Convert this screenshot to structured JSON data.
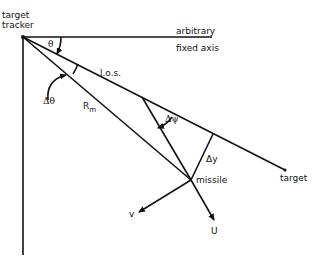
{
  "diagram": {
    "labels": {
      "tracker_line1": "target",
      "tracker_line2": "tracker",
      "theta": "θ",
      "axis_line1": "arbitrary",
      "axis_line2": "fixed axis",
      "los": "l.o.s.",
      "delta_theta": "Δθ",
      "rm": "R",
      "rm_sub": "m",
      "delta_psi": "Δψ",
      "delta_y": "Δy",
      "missile": "missile",
      "target": "target",
      "v": "v",
      "u": "U"
    },
    "points": {
      "tracker": [
        23,
        37
      ],
      "axis_end": [
        212,
        38
      ],
      "vertical_end": [
        23,
        255
      ],
      "target": [
        285,
        170
      ],
      "missile": [
        191,
        180
      ],
      "psi_vertex": [
        142,
        104
      ],
      "dy_foot": [
        213,
        140
      ],
      "v_tip": [
        137,
        213
      ],
      "u_tip": [
        215,
        222
      ]
    },
    "colors": {
      "line": "#111111",
      "background": "#ffffff"
    }
  }
}
